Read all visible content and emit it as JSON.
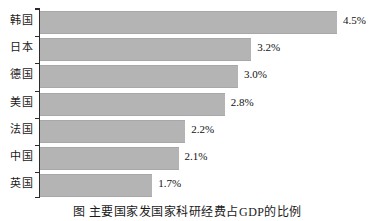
{
  "chart_data": {
    "type": "bar",
    "orientation": "horizontal",
    "title": "",
    "xlabel": "",
    "ylabel": "",
    "categories": [
      "韩国",
      "日本",
      "德国",
      "美国",
      "法国",
      "中国",
      "英国"
    ],
    "values": [
      4.5,
      3.2,
      3.0,
      2.8,
      2.2,
      2.1,
      1.7
    ],
    "value_labels": [
      "4.5%",
      "3.2%",
      "3.0%",
      "2.8%",
      "2.2%",
      "2.1%",
      "1.7%"
    ],
    "xlim": [
      0,
      4.5
    ],
    "grid": false,
    "legend": null,
    "bar_color": "#b4b4b4",
    "axis_color": "#2b2b2b"
  },
  "caption": {
    "text": "图   主要国家发国家科研经费占GDP的比例"
  }
}
